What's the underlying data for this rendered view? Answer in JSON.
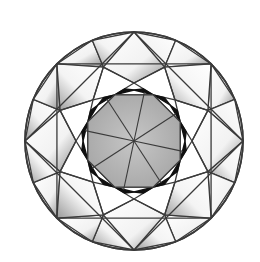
{
  "diagram": {
    "center": [
      134,
      141
    ],
    "girdle_radius": 109,
    "colors": {
      "background": "#ffffff",
      "outline": "#3a3a3a",
      "table": "#b9b9b9",
      "table_dark": "#a4a4a4",
      "shadow": "#101010",
      "facet_shade": "#9a9a9a"
    },
    "facets": {
      "table": {
        "sides": 8
      },
      "star": {
        "count": 8
      },
      "bezel": {
        "count": 8
      },
      "upper_girdle": {
        "count": 16
      }
    }
  }
}
